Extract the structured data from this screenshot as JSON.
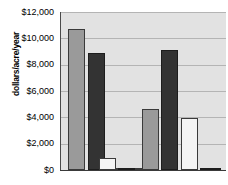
{
  "chart_data": {
    "type": "bar",
    "title": "",
    "xlabel": "",
    "ylabel": "dollars/acre/year",
    "ylim": [
      0,
      12000
    ],
    "ytick_values": [
      0,
      2000,
      4000,
      6000,
      8000,
      10000,
      12000
    ],
    "ytick_labels": [
      "$0",
      "$2,000",
      "$4,000",
      "$6,000",
      "$8,000",
      "$10,000",
      "$12,000"
    ],
    "grid": true,
    "legend": "none",
    "xtick_labels": [
      "",
      "",
      ""
    ],
    "categories": [
      "Group 1",
      "Group 2",
      "Group 3"
    ],
    "series": [
      {
        "name": "Series 1",
        "color": "#9a9a9a",
        "values": [
          10700,
          0,
          4650
        ]
      },
      {
        "name": "Series 2",
        "color": "#333333",
        "values": [
          8900,
          150,
          9150
        ]
      },
      {
        "name": "Series 3",
        "color": "#f4f4f4",
        "values": [
          0,
          900,
          3950
        ]
      }
    ],
    "bars": [
      {
        "series": "Series 1",
        "group": "Group 1",
        "value": 10700,
        "style": "series-gray",
        "x_pct": 4.2,
        "w_pct": 10.3
      },
      {
        "series": "Series 2",
        "group": "Group 1",
        "value": 8900,
        "style": "series-dark",
        "x_pct": 16.4,
        "w_pct": 10.3
      },
      {
        "series": "Series 3",
        "group": "Group 1",
        "value": 0,
        "style": "series-white",
        "x_pct": 28.5,
        "w_pct": 10.3
      },
      {
        "series": "Series 1",
        "group": "Group 2",
        "value": 0,
        "style": "series-gray",
        "x_pct": 40.0,
        "w_pct": 10.3
      },
      {
        "series": "Series 2",
        "group": "Group 2",
        "value": 900,
        "style": "series-white",
        "x_pct": 23.0,
        "w_pct": 10.3
      },
      {
        "series": "Series 3",
        "group": "Group 2",
        "value": 150,
        "style": "series-dark",
        "x_pct": 34.5,
        "w_pct": 10.3
      },
      {
        "series": "Series 1",
        "group": "Group 3",
        "value": 4650,
        "style": "series-gray",
        "x_pct": 49.0,
        "w_pct": 10.3
      },
      {
        "series": "Series 2",
        "group": "Group 3",
        "value": 9150,
        "style": "series-dark",
        "x_pct": 60.5,
        "w_pct": 10.3
      },
      {
        "series": "Series 3",
        "group": "Group 3",
        "value": 3950,
        "style": "series-white",
        "x_pct": 72.5,
        "w_pct": 10.3
      },
      {
        "series": "Series 4",
        "group": "Group 3",
        "value": 80,
        "style": "series-dark",
        "x_pct": 84.0,
        "w_pct": 13.0
      }
    ],
    "colors": {
      "plot_background": "#e2e2e2",
      "gridline": "#b4b4b4",
      "axis": "#3a3a3a",
      "series_gray": "#9a9a9a",
      "series_dark": "#333333",
      "series_white": "#f4f4f4"
    }
  }
}
